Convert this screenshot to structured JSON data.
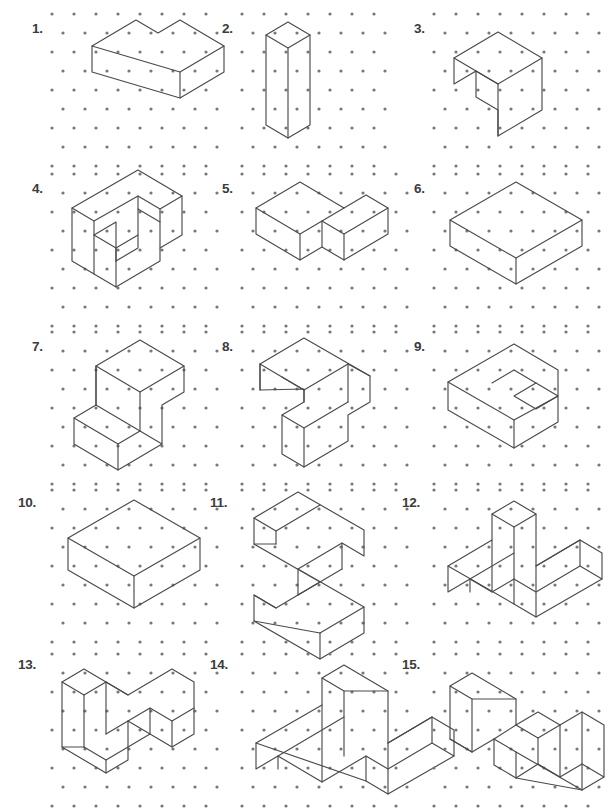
{
  "page": {
    "width": 581,
    "height": 799,
    "background": "#ffffff",
    "line_color": "#4a4a4a",
    "dot_color": "#787878",
    "label_color": "#3b3b3b"
  },
  "grid": {
    "type": "isometric-dot-lattice",
    "dx": 22,
    "dy": 19,
    "dot_radius": 1.6,
    "columns": 3,
    "rows": 5
  },
  "figures": [
    {
      "number": "1.",
      "label_x": 32,
      "label_y": 22,
      "origin_x": 48,
      "origin_y": 8,
      "cols": 7,
      "rows": 8,
      "paths": [
        "M 44,38 L 88,12 L 110,25 L 132,12 L 176,38 L 176,64 L 132,90 L 44,64 Z",
        "M 44,38 L 132,64 L 176,38",
        "M 132,64 L 132,90"
      ]
    },
    {
      "number": "2.",
      "label_x": 222,
      "label_y": 22,
      "origin_x": 238,
      "origin_y": 8,
      "cols": 6,
      "rows": 8,
      "paths": [
        "M 28,27 L 50,14 L 72,27 L 72,117 L 50,130 L 28,117 Z",
        "M 28,27 L 50,40 L 72,27",
        "M 50,40 L 50,130"
      ]
    },
    {
      "number": "3.",
      "label_x": 414,
      "label_y": 22,
      "origin_x": 430,
      "origin_y": 8,
      "cols": 7,
      "rows": 8,
      "paths": [
        "M 24,50 L 68,24 L 112,50 L 112,102 L 68,128 L 68,102 L 46,89 L 46,63 L 24,76 Z",
        "M 24,50 L 68,76 L 112,50",
        "M 68,76 L 68,128",
        "M 46,63 L 68,76"
      ]
    },
    {
      "number": "4.",
      "label_x": 32,
      "label_y": 182,
      "origin_x": 48,
      "origin_y": 168,
      "cols": 7,
      "rows": 8,
      "paths": [
        "M 24,40 L 90,2 L 134,28 L 134,67 L 112,80 L 112,54 L 90,41 L 90,80 L 68,93 L 68,54 L 46,67 L 46,106 L 24,93 Z",
        "M 24,40 L 46,53 L 90,28 L 112,41 L 134,28",
        "M 46,53 L 46,67",
        "M 90,28 L 90,41",
        "M 112,41 L 112,54",
        "M 46,106 L 68,119 L 112,93 L 112,80",
        "M 68,93 L 68,119",
        "M 46,67 L 68,80 L 90,67",
        "M 68,80 L 68,93"
      ]
    },
    {
      "number": "5.",
      "label_x": 222,
      "label_y": 182,
      "origin_x": 238,
      "origin_y": 168,
      "cols": 7,
      "rows": 8,
      "paths": [
        "M 18,40 L 62,14 L 106,40 L 128,27 L 150,40 L 150,66 L 106,92 L 84,79 L 62,92 L 18,66 Z",
        "M 18,40 L 62,66 L 62,92",
        "M 62,66 L 106,40",
        "M 84,53 L 84,79",
        "M 84,53 L 106,66 L 150,40",
        "M 106,66 L 106,92"
      ]
    },
    {
      "number": "6.",
      "label_x": 414,
      "label_y": 182,
      "origin_x": 430,
      "origin_y": 168,
      "cols": 7,
      "rows": 8,
      "paths": [
        "M 20,52 L 86,14 L 152,52 L 152,78 L 86,116 L 20,78 Z",
        "M 20,52 L 86,90 L 152,52",
        "M 86,90 L 86,116"
      ]
    },
    {
      "number": "7.",
      "label_x": 32,
      "label_y": 340,
      "origin_x": 48,
      "origin_y": 326,
      "cols": 7,
      "rows": 8,
      "paths": [
        "M 48,40 L 92,14 L 136,40 L 136,66 L 114,79 L 114,118 L 70,144 L 26,118 L 26,92 L 48,79 Z",
        "M 48,40 L 92,66 L 136,40",
        "M 92,66 L 92,105 L 70,118 L 70,144",
        "M 92,105 L 114,118",
        "M 26,92 L 70,118",
        "M 48,79 L 92,105",
        "M 48,40 L 48,79"
      ]
    },
    {
      "number": "8.",
      "label_x": 222,
      "label_y": 340,
      "origin_x": 238,
      "origin_y": 326,
      "cols": 7,
      "rows": 8,
      "paths": [
        "M 22,38 L 66,12 L 132,50 L 132,76 L 110,89 L 110,115 L 66,141 L 44,128 L 44,89 L 66,76 L 66,63 L 22,64 Z",
        "M 22,38 L 66,64 L 110,38",
        "M 66,64 L 66,76",
        "M 44,51 L 66,64",
        "M 44,89 L 66,102 L 110,76",
        "M 66,102 L 66,141",
        "M 110,38 L 132,50",
        "M 110,38 L 110,76",
        "M 22,38 L 22,64"
      ]
    },
    {
      "number": "9.",
      "label_x": 414,
      "label_y": 340,
      "origin_x": 430,
      "origin_y": 326,
      "cols": 7,
      "rows": 8,
      "paths": [
        "M 18,56 L 84,18 L 128,44 L 128,70 L 106,57 L 84,70 L 106,83 L 128,70 L 128,96 L 84,122 L 18,84 Z",
        "M 18,56 L 84,94 L 128,70",
        "M 84,94 L 84,122",
        "M 84,44 L 106,57",
        "M 84,44 L 62,57"
      ]
    },
    {
      "number": "10.",
      "label_x": 18,
      "label_y": 496,
      "origin_x": 48,
      "origin_y": 484,
      "cols": 7,
      "rows": 8,
      "paths": [
        "M 20,54 L 86,16 L 152,54 L 152,86 L 86,124 L 20,86 Z",
        "M 20,54 L 86,92 L 152,54",
        "M 86,92 L 86,124"
      ]
    },
    {
      "number": "11.",
      "label_x": 210,
      "label_y": 496,
      "origin_x": 238,
      "origin_y": 484,
      "cols": 7,
      "rows": 8,
      "paths": [
        "M 16,34 L 60,8 L 126,46 L 126,72 L 104,59 L 60,85 L 126,123 L 126,149 L 82,175 L 16,137 L 16,111 L 38,124 L 82,98 L 16,60 Z",
        "M 16,34 L 38,47 L 82,21",
        "M 38,47 L 38,60",
        "M 16,60 L 38,60",
        "M 104,59 L 104,85",
        "M 60,85 L 60,111",
        "M 16,111 L 38,124",
        "M 82,149 L 126,123",
        "M 82,149 L 82,175",
        "M 16,137 L 82,149",
        "M 104,85 L 60,111"
      ]
    },
    {
      "number": "12.",
      "label_x": 402,
      "label_y": 496,
      "origin_x": 430,
      "origin_y": 484,
      "cols": 7,
      "rows": 8,
      "paths": [
        "M 62,30 L 84,17 L 106,30 L 106,82 L 150,56 L 172,69 L 172,95 L 106,133 L 84,120 L 84,95 L 62,108 L 40,95 L 18,108 L 18,82 L 62,56 Z",
        "M 62,30 L 84,43 L 106,30",
        "M 84,43 L 84,95",
        "M 62,56 L 62,108",
        "M 18,82 L 84,120",
        "M 84,95 L 106,108 L 150,82 L 172,95",
        "M 106,82 L 150,56",
        "M 150,56 L 150,82",
        "M 106,82 L 106,133",
        "M 40,95 L 84,69",
        "M 40,95 L 40,108"
      ]
    },
    {
      "number": "13.",
      "label_x": 18,
      "label_y": 658,
      "origin_x": 48,
      "origin_y": 648,
      "cols": 7,
      "rows": 8,
      "paths": [
        "M 14,34 L 36,21 L 80,47 L 124,21 L 146,34 L 146,86 L 124,99 L 102,86 L 102,60 L 80,73 L 80,112 L 58,125 L 14,99 Z",
        "M 14,34 L 36,47 L 58,34",
        "M 36,47 L 36,99",
        "M 14,99 L 36,99",
        "M 58,34 L 80,47",
        "M 58,34 L 58,86",
        "M 36,99 L 58,112 L 102,86",
        "M 58,112 L 58,125",
        "M 102,60 L 124,73 L 146,60",
        "M 124,73 L 124,99",
        "M 80,73 L 102,86",
        "M 58,86 L 80,73"
      ]
    },
    {
      "number": "14.",
      "label_x": 210,
      "label_y": 658,
      "origin_x": 238,
      "origin_y": 648,
      "cols": 7,
      "rows": 8,
      "paths": [
        "M 84,30 L 106,17 L 150,43 L 150,95 L 194,69 L 216,82 L 216,108 L 150,146 L 128,133 L 128,108 L 84,134 L 40,108 L 18,121 L 18,95 L 84,57 Z",
        "M 84,30 L 106,43 L 150,43",
        "M 106,43 L 106,108",
        "M 84,57 L 84,134",
        "M 18,95 L 128,133",
        "M 128,108 L 150,121 L 194,95 L 216,108",
        "M 150,95 L 194,69",
        "M 194,69 L 194,95",
        "M 150,95 L 150,146",
        "M 40,108 L 106,69",
        "M 40,108 L 40,121"
      ]
    },
    {
      "number": "15.",
      "label_x": 402,
      "label_y": 658,
      "origin_x": 430,
      "origin_y": 648,
      "cols": 7,
      "rows": 8,
      "paths": [
        "M 20,38 L 42,25 L 86,51 L 86,77 L 108,64 L 130,77 L 152,64 L 174,77 L 174,129 L 152,142 L 86,104 L 86,130 L 64,117 L 64,91 L 42,104 L 20,91 Z",
        "M 20,38 L 42,51 L 86,51",
        "M 42,51 L 42,104",
        "M 20,91 L 42,104",
        "M 86,77 L 108,90 L 130,77",
        "M 108,90 L 108,116",
        "M 64,91 L 86,104",
        "M 86,77 L 64,91",
        "M 108,116 L 130,129 L 152,116",
        "M 130,77 L 130,129",
        "M 152,64 L 152,142",
        "M 152,116 L 174,129",
        "M 86,130 L 152,142",
        "M 108,116 L 86,130"
      ]
    }
  ]
}
